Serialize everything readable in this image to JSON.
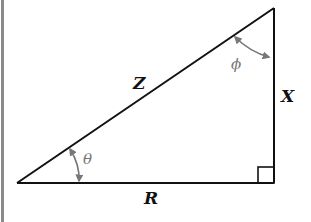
{
  "diagram": {
    "type": "right-triangle",
    "sides": {
      "hypotenuse": "Z",
      "horizontal": "R",
      "vertical": "X"
    },
    "angles": {
      "base_angle": "θ",
      "top_angle": "ϕ"
    },
    "right_angle_marker": true,
    "colors": {
      "lines": "#111111",
      "angle_arrows": "#777777",
      "border": "#8a8a8a"
    }
  }
}
